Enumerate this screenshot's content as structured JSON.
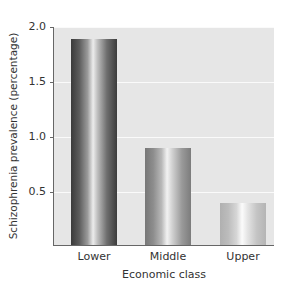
{
  "chart_data": {
    "type": "bar",
    "title": "",
    "xlabel": "Economic class",
    "ylabel": "Schizophrenia prevalence (percentage)",
    "categories": [
      "Lower",
      "Middle",
      "Upper"
    ],
    "values": [
      1.89,
      0.9,
      0.4
    ],
    "ylim": [
      0,
      2.0
    ],
    "yticks": [
      "2.0",
      "1.5",
      "1.0",
      "0.5"
    ],
    "grid": true,
    "legend": null,
    "bar_shading": [
      "dark",
      "mid",
      "light"
    ]
  },
  "axes": {
    "x_title": "Economic class",
    "y_title": "Schizophrenia prevalence (percentage)",
    "y_ticks": [
      {
        "label": "2.0",
        "value": 2.0
      },
      {
        "label": "1.5",
        "value": 1.5
      },
      {
        "label": "1.0",
        "value": 1.0
      },
      {
        "label": "0.5",
        "value": 0.5
      }
    ]
  },
  "bars": [
    {
      "label": "Lower",
      "value": 1.89,
      "shade": "dark"
    },
    {
      "label": "Middle",
      "value": 0.9,
      "shade": "mid"
    },
    {
      "label": "Upper",
      "value": 0.4,
      "shade": "light"
    }
  ],
  "colors": {
    "plot_background": "#e6e6e6",
    "gridline": "#fafafa",
    "axis": "#666666",
    "text": "#333333"
  }
}
